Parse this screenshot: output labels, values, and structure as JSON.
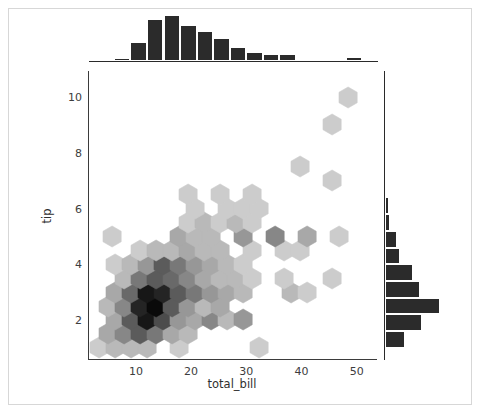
{
  "figure": {
    "background": "#ffffff",
    "frame_color": "#d7d7d7",
    "width": 482,
    "height": 416
  },
  "chart_data": {
    "type": "scatter",
    "subtype": "hexbin-jointplot",
    "title": "",
    "xlabel": "total_bill",
    "ylabel": "tip",
    "xlim": [
      1.5,
      53.5
    ],
    "ylim": [
      0.6,
      10.9
    ],
    "xticks": [
      10,
      20,
      30,
      40,
      50
    ],
    "yticks": [
      2,
      4,
      6,
      8,
      10
    ],
    "grid": false,
    "legend": null,
    "colormap": "Greys",
    "colormap_min": "#ffffff",
    "colormap_max": "#0b0b0b",
    "gridsize": 18,
    "hexbins": [
      {
        "x": 3.4,
        "y": 1.0,
        "count": 2
      },
      {
        "x": 6.3,
        "y": 1.0,
        "count": 3
      },
      {
        "x": 9.2,
        "y": 1.0,
        "count": 3
      },
      {
        "x": 12.1,
        "y": 1.0,
        "count": 3
      },
      {
        "x": 17.9,
        "y": 1.0,
        "count": 2
      },
      {
        "x": 32.4,
        "y": 1.0,
        "count": 2
      },
      {
        "x": 4.9,
        "y": 1.5,
        "count": 4
      },
      {
        "x": 7.8,
        "y": 1.5,
        "count": 6
      },
      {
        "x": 10.7,
        "y": 1.5,
        "count": 9
      },
      {
        "x": 13.6,
        "y": 1.5,
        "count": 7
      },
      {
        "x": 16.5,
        "y": 1.5,
        "count": 4
      },
      {
        "x": 19.4,
        "y": 1.5,
        "count": 3
      },
      {
        "x": 6.3,
        "y": 2.0,
        "count": 4
      },
      {
        "x": 9.2,
        "y": 2.0,
        "count": 9
      },
      {
        "x": 12.1,
        "y": 2.0,
        "count": 14
      },
      {
        "x": 15.0,
        "y": 2.0,
        "count": 10
      },
      {
        "x": 17.9,
        "y": 2.0,
        "count": 5
      },
      {
        "x": 20.8,
        "y": 2.0,
        "count": 4
      },
      {
        "x": 23.7,
        "y": 2.0,
        "count": 6
      },
      {
        "x": 26.6,
        "y": 2.0,
        "count": 3
      },
      {
        "x": 29.5,
        "y": 2.0,
        "count": 5
      },
      {
        "x": 4.9,
        "y": 2.5,
        "count": 3
      },
      {
        "x": 7.8,
        "y": 2.5,
        "count": 6
      },
      {
        "x": 10.7,
        "y": 2.5,
        "count": 13
      },
      {
        "x": 13.6,
        "y": 2.5,
        "count": 15
      },
      {
        "x": 16.5,
        "y": 2.5,
        "count": 9
      },
      {
        "x": 19.4,
        "y": 2.5,
        "count": 5
      },
      {
        "x": 22.3,
        "y": 2.5,
        "count": 3
      },
      {
        "x": 25.2,
        "y": 2.5,
        "count": 4
      },
      {
        "x": 6.3,
        "y": 3.0,
        "count": 4
      },
      {
        "x": 9.2,
        "y": 3.0,
        "count": 8
      },
      {
        "x": 12.1,
        "y": 3.0,
        "count": 14
      },
      {
        "x": 15.0,
        "y": 3.0,
        "count": 13
      },
      {
        "x": 17.9,
        "y": 3.0,
        "count": 9
      },
      {
        "x": 20.8,
        "y": 3.0,
        "count": 7
      },
      {
        "x": 23.7,
        "y": 3.0,
        "count": 5
      },
      {
        "x": 26.6,
        "y": 3.0,
        "count": 4
      },
      {
        "x": 29.5,
        "y": 3.0,
        "count": 3
      },
      {
        "x": 38.2,
        "y": 3.0,
        "count": 3
      },
      {
        "x": 41.1,
        "y": 3.0,
        "count": 2
      },
      {
        "x": 7.8,
        "y": 3.5,
        "count": 3
      },
      {
        "x": 10.7,
        "y": 3.5,
        "count": 7
      },
      {
        "x": 13.6,
        "y": 3.5,
        "count": 9
      },
      {
        "x": 16.5,
        "y": 3.5,
        "count": 8
      },
      {
        "x": 19.4,
        "y": 3.5,
        "count": 6
      },
      {
        "x": 22.3,
        "y": 3.5,
        "count": 4
      },
      {
        "x": 25.2,
        "y": 3.5,
        "count": 3
      },
      {
        "x": 28.1,
        "y": 3.5,
        "count": 3
      },
      {
        "x": 31.0,
        "y": 3.5,
        "count": 2
      },
      {
        "x": 36.8,
        "y": 3.5,
        "count": 2
      },
      {
        "x": 45.5,
        "y": 3.5,
        "count": 2
      },
      {
        "x": 6.3,
        "y": 4.0,
        "count": 2
      },
      {
        "x": 9.2,
        "y": 4.0,
        "count": 3
      },
      {
        "x": 12.1,
        "y": 4.0,
        "count": 5
      },
      {
        "x": 15.0,
        "y": 4.0,
        "count": 9
      },
      {
        "x": 17.9,
        "y": 4.0,
        "count": 7
      },
      {
        "x": 20.8,
        "y": 4.0,
        "count": 5
      },
      {
        "x": 23.7,
        "y": 4.0,
        "count": 4
      },
      {
        "x": 26.6,
        "y": 4.0,
        "count": 3
      },
      {
        "x": 29.5,
        "y": 4.0,
        "count": 2
      },
      {
        "x": 10.7,
        "y": 4.5,
        "count": 2
      },
      {
        "x": 13.6,
        "y": 4.5,
        "count": 3
      },
      {
        "x": 16.5,
        "y": 4.5,
        "count": 3
      },
      {
        "x": 19.4,
        "y": 4.5,
        "count": 4
      },
      {
        "x": 22.3,
        "y": 4.5,
        "count": 3
      },
      {
        "x": 25.2,
        "y": 4.5,
        "count": 3
      },
      {
        "x": 31.0,
        "y": 4.5,
        "count": 2
      },
      {
        "x": 36.8,
        "y": 4.5,
        "count": 2
      },
      {
        "x": 39.7,
        "y": 4.5,
        "count": 2
      },
      {
        "x": 5.6,
        "y": 5.0,
        "count": 2
      },
      {
        "x": 17.9,
        "y": 5.0,
        "count": 4
      },
      {
        "x": 20.8,
        "y": 5.0,
        "count": 3
      },
      {
        "x": 23.7,
        "y": 5.0,
        "count": 3
      },
      {
        "x": 29.5,
        "y": 5.0,
        "count": 5
      },
      {
        "x": 35.3,
        "y": 5.0,
        "count": 6
      },
      {
        "x": 41.1,
        "y": 5.0,
        "count": 4
      },
      {
        "x": 46.9,
        "y": 5.0,
        "count": 2
      },
      {
        "x": 19.4,
        "y": 5.5,
        "count": 2
      },
      {
        "x": 22.3,
        "y": 5.5,
        "count": 3
      },
      {
        "x": 25.2,
        "y": 5.5,
        "count": 2
      },
      {
        "x": 28.1,
        "y": 5.5,
        "count": 3
      },
      {
        "x": 31.0,
        "y": 5.5,
        "count": 2
      },
      {
        "x": 20.8,
        "y": 6.0,
        "count": 2
      },
      {
        "x": 26.6,
        "y": 6.0,
        "count": 2
      },
      {
        "x": 29.5,
        "y": 6.0,
        "count": 2
      },
      {
        "x": 32.4,
        "y": 6.0,
        "count": 2
      },
      {
        "x": 19.4,
        "y": 6.5,
        "count": 2
      },
      {
        "x": 25.2,
        "y": 6.5,
        "count": 2
      },
      {
        "x": 31.0,
        "y": 6.5,
        "count": 2
      },
      {
        "x": 45.5,
        "y": 7.0,
        "count": 2
      },
      {
        "x": 39.7,
        "y": 7.5,
        "count": 2
      },
      {
        "x": 45.5,
        "y": 9.0,
        "count": 2
      },
      {
        "x": 48.4,
        "y": 10.0,
        "count": 2
      }
    ],
    "marginal_x": {
      "type": "bar",
      "orientation": "vertical",
      "color": "#2b2b2b",
      "bin_edges": [
        3.0,
        6.0,
        9.0,
        12.0,
        15.0,
        18.0,
        21.0,
        24.0,
        27.0,
        30.0,
        33.0,
        36.0,
        39.0,
        42.0,
        45.0,
        48.0,
        51.0
      ],
      "counts": [
        1,
        3,
        17,
        38,
        42,
        33,
        27,
        21,
        13,
        8,
        6,
        6,
        2,
        2,
        1,
        4
      ]
    },
    "marginal_y": {
      "type": "bar",
      "orientation": "horizontal",
      "color": "#2b2b2b",
      "bin_edges": [
        1.0,
        1.6,
        2.2,
        2.8,
        3.4,
        4.0,
        4.6,
        5.2,
        5.8,
        6.4,
        7.0,
        7.6,
        8.2,
        8.8,
        9.4,
        10.0
      ],
      "counts": [
        22,
        42,
        62,
        40,
        32,
        17,
        13,
        6,
        4,
        2,
        1,
        0,
        0,
        1,
        1
      ]
    }
  },
  "axes": {
    "xticklabels": [
      "10",
      "20",
      "30",
      "40",
      "50"
    ],
    "yticklabels": [
      "2",
      "4",
      "6",
      "8",
      "10"
    ],
    "xlabel": "total_bill",
    "ylabel": "tip",
    "spine_color": "#3b3b3b",
    "tick_color": "#3d3d3d"
  }
}
